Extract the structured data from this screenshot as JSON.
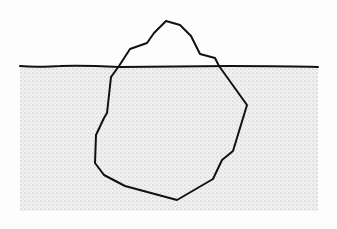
{
  "diagram": {
    "title": "",
    "colors": {
      "background": "#fdfdfd",
      "water": "#f1f1f1",
      "stipple": "#9a9a9a",
      "outline": "#111111"
    },
    "water": {
      "x": 20,
      "y": 66,
      "width": 298,
      "height": 145
    },
    "waterline": "M20,66 C40,68 50,66 60,66 C80,65 100,66 120,67 C150,67 200,66 230,66 C260,66 290,66 318,67",
    "iceberg_outline": "M130,49 L147,43 L154,33 L166,21 L180,25 L191,36 L200,54 L215,58 L219,66 L247,105 L233,151 L222,160 L213,179 L177,200 L125,186 L104,175 L95,163 L96,135 L104,118 L107,113 L111,77 L119,66 Z"
  }
}
